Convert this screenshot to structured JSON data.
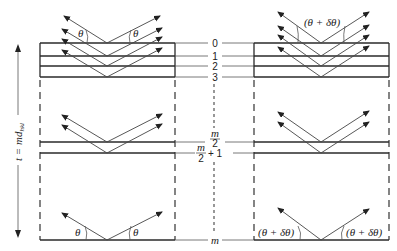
{
  "diagram": {
    "thickness_label": "t = md",
    "thickness_subscript": "hkl",
    "plane_labels": [
      "0",
      "1",
      "2",
      "3",
      "m/2",
      "m/2 + 1",
      "m"
    ],
    "plane_label_0": "0",
    "plane_label_1": "1",
    "plane_label_2": "2",
    "plane_label_3": "3",
    "plane_label_mid_num": "m",
    "plane_label_mid_den": "2",
    "plane_label_mid_plus": "+ 1",
    "plane_label_m": "m",
    "left_panel": {
      "angle_label": "θ",
      "description": "Exact Bragg angle θ"
    },
    "right_panel": {
      "angle_label": "(θ + δθ)",
      "description": "Deviation from Bragg angle θ + δθ"
    },
    "colors": {
      "line": "#2a2a2a",
      "background": "#ffffff"
    }
  }
}
